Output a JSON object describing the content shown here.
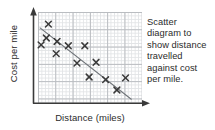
{
  "figure": {
    "kind": "scatter-diagram",
    "ink_color": "#3a3a3a",
    "grid_minor_color": "#e2e4e6",
    "grid_major_color": "#b9bcc0",
    "background": "#ffffff"
  },
  "caption": {
    "full_text": "Scatter diagram to show distance travelled against cost per mile.",
    "lines": [
      "Scatter",
      "diagram to",
      "show distance",
      "travelled",
      "against cost",
      "per mile."
    ]
  },
  "chart_data": {
    "type": "scatter",
    "title": "Scatter diagram to show distance travelled against cost per mile.",
    "xlabel": "Distance (miles)",
    "ylabel": "Cost per mile",
    "xlim": [
      0,
      6
    ],
    "ylim": [
      0,
      5.25
    ],
    "grid": true,
    "grid_major_step_x": 1,
    "grid_major_step_y": 1,
    "grid_minor_step_x": 0.2,
    "grid_minor_step_y": 0.2,
    "axis_tick_labels": false,
    "legend": "none",
    "marker": "x",
    "correlation": "negative",
    "points": [
      {
        "x": 0.6,
        "y": 4.55
      },
      {
        "x": 0.48,
        "y": 3.75
      },
      {
        "x": 0.18,
        "y": 3.35
      },
      {
        "x": 1.1,
        "y": 3.55
      },
      {
        "x": 1.05,
        "y": 2.85
      },
      {
        "x": 1.75,
        "y": 3.3
      },
      {
        "x": 2.7,
        "y": 3.3
      },
      {
        "x": 2.25,
        "y": 2.3
      },
      {
        "x": 3.35,
        "y": 2.35
      },
      {
        "x": 2.95,
        "y": 1.5
      },
      {
        "x": 3.9,
        "y": 1.35
      },
      {
        "x": 5.05,
        "y": 1.45
      },
      {
        "x": 4.55,
        "y": 0.75
      }
    ],
    "trend_line": {
      "label": "line of best fit",
      "x0": 0.1,
      "y0": 4.35,
      "x1": 5.4,
      "y1": 0.2
    },
    "annotations": []
  },
  "axes": {
    "y_arrow": "up-arrow-head",
    "x_arrow": "right-arrow-head"
  }
}
